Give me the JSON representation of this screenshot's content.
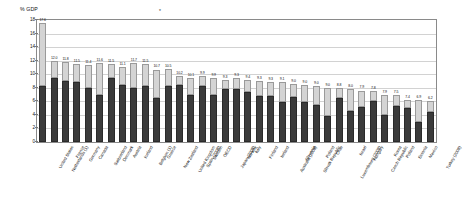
{
  "chart": {
    "ylabel": "% GDP",
    "top_marker": "*",
    "yticks": [
      "18",
      "16",
      "14",
      "12",
      "10",
      "8",
      "6",
      "4",
      "2",
      "0"
    ],
    "legend": [
      {
        "label": "Public",
        "color": "#3b3b3b"
      },
      {
        "label": "Private",
        "color": "#e2e2e2"
      }
    ]
  },
  "chart_data": {
    "type": "bar",
    "title": "",
    "subtype": "stacked",
    "xlabel": "",
    "ylabel": "% GDP",
    "ylim": [
      0,
      18
    ],
    "grid": true,
    "legend_position": "top-right",
    "categories": [
      "United States",
      "Netherlands (1)",
      "France",
      "Germany",
      "Canada",
      "Switzerland",
      "Denmark",
      "Austria",
      "Iceland",
      "Belgium (1)",
      "Greece",
      "New Zealand",
      "United Kingdom",
      "Spain (2008)",
      "Sweden",
      "OECD",
      "Japan (2008)",
      "Norway",
      "Italy",
      "Finland",
      "Ireland",
      "Australia (2008)",
      "Slovenia",
      "Slovak Republic",
      "Poland",
      "Chile",
      "Luxembourg (2008)",
      "Israel",
      "Hungary",
      "Czech Republic",
      "Korea",
      "Poland",
      "Estonia",
      "Mexico",
      "Turkey (2008)"
    ],
    "series": [
      {
        "name": "Public",
        "color": "#3b3b3b",
        "values": [
          8.3,
          9.5,
          9.0,
          8.9,
          8.0,
          7.0,
          9.4,
          8.4,
          7.9,
          8.2,
          6.5,
          8.3,
          8.4,
          7.0,
          8.2,
          6.9,
          7.8,
          7.8,
          7.4,
          6.8,
          6.8,
          5.9,
          6.6,
          5.9,
          5.4,
          3.8,
          6.5,
          4.6,
          5.2,
          6.1,
          4.0,
          5.3,
          5.0,
          3.0,
          4.4
        ],
        "labels": [
          "",
          "",
          "",
          "",
          "",
          "",
          "",
          "",
          "",
          "",
          "",
          "",
          "",
          "",
          "",
          "",
          "",
          "",
          "",
          "",
          "",
          "",
          "",
          "",
          "",
          "",
          "",
          "",
          "",
          "",
          "",
          "",
          "",
          "",
          ""
        ]
      },
      {
        "name": "Private",
        "color": "#d4d4d4",
        "values": [
          9.3,
          2.5,
          2.8,
          2.6,
          3.4,
          4.6,
          2.1,
          2.7,
          3.8,
          3.3,
          4.2,
          2.4,
          1.3,
          2.5,
          1.5,
          2.6,
          1.4,
          1.6,
          1.7,
          2.2,
          2.1,
          2.9,
          2.0,
          2.5,
          2.9,
          4.2,
          1.4,
          3.2,
          2.4,
          1.4,
          3.0,
          1.6,
          1.2,
          3.2,
          1.7
        ],
        "labels": [
          "",
          "",
          "",
          "",
          "",
          "",
          "",
          "",
          "",
          "",
          "",
          "",
          "",
          "",
          "",
          "",
          "",
          "",
          "",
          "",
          "",
          "",
          "",
          "",
          "",
          "",
          "",
          "",
          "",
          "",
          "",
          "",
          "",
          "",
          ""
        ]
      }
    ],
    "totals": [
      17.6,
      12.0,
      11.8,
      11.5,
      11.4,
      11.6,
      11.5,
      11.1,
      11.7,
      11.5,
      10.7,
      10.5,
      10.2,
      10.1,
      9.9,
      9.9,
      9.5,
      9.4,
      9.3,
      9.3,
      9.0,
      8.9,
      8.7,
      9.1,
      9.0,
      9.0,
      8.8,
      8.0,
      7.9,
      7.8,
      7.9,
      7.5,
      7.4,
      7.8,
      6.9,
      6.2,
      6.1
    ],
    "total_labels": [
      "17.6",
      "12.0",
      "11.8",
      "11.5",
      "11.4",
      "11.6",
      "11.5",
      "11.1",
      "11.7",
      "11.5",
      "10.7",
      "10.5",
      "10.2",
      "10.1",
      "9.9",
      "9.9",
      "9.3",
      "9.3",
      "9.4",
      "9.3",
      "9.3",
      "9.1",
      "9.0",
      "9.0",
      "9.0",
      "9.0",
      "8.8",
      "8.0",
      "7.9",
      "7.8",
      "7.9",
      "7.5",
      "7.4",
      "6.9",
      "6.2",
      "6.1"
    ]
  }
}
